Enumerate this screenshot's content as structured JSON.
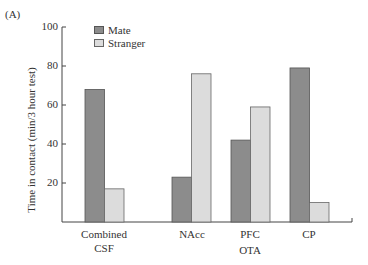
{
  "panel_label": "(A)",
  "colors": {
    "mate": "#8c8c8c",
    "mate_stroke": "#555555",
    "stranger": "#dcdcdc",
    "stranger_stroke": "#666666",
    "axis": "#444444"
  },
  "chart_data": {
    "type": "bar",
    "title": "",
    "xlabel": "",
    "ylabel": "Time in contact (min/3 hour test)",
    "ylim": [
      0,
      100
    ],
    "yticks": [
      20,
      40,
      60,
      80,
      100
    ],
    "grid": false,
    "legend_position": "top-left inside",
    "categories": [
      "Combined CSF",
      "NAcc",
      "PFC",
      "CP"
    ],
    "category_labels": [
      [
        "Combined",
        "CSF"
      ],
      [
        "NAcc"
      ],
      [
        "PFC"
      ],
      [
        "CP"
      ]
    ],
    "group_label": {
      "text": "OTA",
      "spans": [
        "NAcc",
        "PFC",
        "CP"
      ]
    },
    "series": [
      {
        "name": "Mate",
        "values": [
          68,
          23,
          42,
          79
        ]
      },
      {
        "name": "Stranger",
        "values": [
          17,
          76,
          59,
          10
        ]
      }
    ]
  },
  "legend": [
    {
      "label": "Mate"
    },
    {
      "label": "Stranger"
    }
  ],
  "yticks": [
    {
      "label": "20"
    },
    {
      "label": "40"
    },
    {
      "label": "60"
    },
    {
      "label": "80"
    },
    {
      "label": "100"
    }
  ],
  "x_labels": {
    "combined_1": "Combined",
    "combined_2": "CSF",
    "nacc": "NAcc",
    "pfc": "PFC",
    "cp": "CP",
    "ota": "OTA"
  }
}
